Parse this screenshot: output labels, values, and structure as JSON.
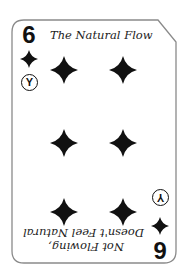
{
  "card": {
    "rank": "6",
    "suit": "diamond",
    "suit_icon": "diamond-icon",
    "badge_letter": "Y",
    "colors": {
      "ink": "#111111",
      "border": "#8a8a8a",
      "background": "#ffffff"
    },
    "top_caption": "The Natural Flow",
    "bottom_caption": {
      "line1": "Not Flowing,",
      "line2": "Doesn't Feel Natural"
    },
    "pips": [
      {
        "x": 50,
        "y": 55
      },
      {
        "x": 109,
        "y": 55
      },
      {
        "x": 50,
        "y": 128
      },
      {
        "x": 109,
        "y": 128
      },
      {
        "x": 50,
        "y": 197
      },
      {
        "x": 109,
        "y": 197
      }
    ]
  }
}
